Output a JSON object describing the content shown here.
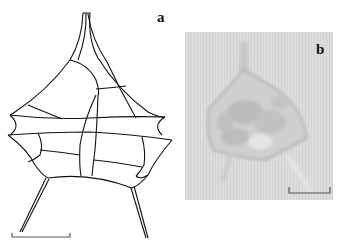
{
  "figure": {
    "panels": [
      {
        "id": "a",
        "label": "a",
        "type": "line-drawing",
        "subject": "dinoflagellate theca outline with plates and horns"
      },
      {
        "id": "b",
        "label": "b",
        "type": "light-micrograph",
        "subject": "dinoflagellate cell"
      }
    ],
    "scale_bars": [
      {
        "panel": "a",
        "length_px": 58
      },
      {
        "panel": "b",
        "length_px": 40
      }
    ],
    "colors": {
      "drawing_line": "#111111",
      "micrograph_bg": "#dcdcdc",
      "scale_bar": "#555555"
    }
  }
}
